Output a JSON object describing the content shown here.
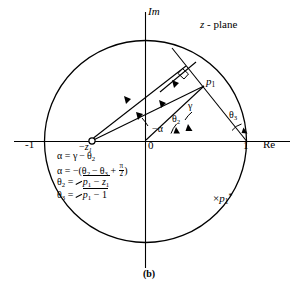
{
  "figure": {
    "caption": "(b)",
    "plane_label": "z - plane",
    "axes": {
      "imaginary_label": "Im",
      "real_label": "Re",
      "origin_label": "0",
      "unit_positive_label": "1",
      "unit_negative_label": "-1"
    },
    "points": [
      {
        "name": "zero-minus-z1",
        "label_base": "-z",
        "label_sub": "1",
        "marker": "circle"
      },
      {
        "name": "pole-p1",
        "label_base": "p",
        "label_sub": "1",
        "marker": "none"
      },
      {
        "name": "pole-p1-conjugate",
        "label_base": "p",
        "label_sub": "1",
        "label_sup": "*",
        "marker": "×"
      }
    ],
    "angles": [
      {
        "name": "alpha",
        "label": "−α"
      },
      {
        "name": "gamma",
        "label": "γ"
      },
      {
        "name": "theta2",
        "label_base": "θ",
        "label_sub": "2"
      },
      {
        "name": "theta3",
        "label_base": "θ",
        "label_sub": "3"
      }
    ],
    "equations": [
      {
        "id": "eq-alpha-gamma-theta2",
        "text": "α = γ − θ2"
      },
      {
        "id": "eq-alpha-expanded",
        "text": "α = −(θ2 − θ3 + π/2)"
      },
      {
        "id": "eq-theta2-def",
        "text": "θ2 = ∠ p1 − z1"
      },
      {
        "id": "eq-theta3-def",
        "text": "θ3 = ∠ p1 − 1"
      }
    ],
    "equation_tokens": {
      "alpha": "α",
      "gamma": "γ",
      "theta": "θ",
      "equals": "=",
      "minus": "−",
      "plus": "+",
      "pi": "π",
      "two": "2",
      "one": "1",
      "sub_1": "1",
      "sub_2": "2",
      "sub_3": "3",
      "p": "p",
      "z": "z",
      "paren_open": "(",
      "paren_close": ")",
      "neg_prefix": "−"
    },
    "colors": {
      "stroke": "#000000",
      "background": "#ffffff"
    },
    "unit_circle": {
      "radius_label": "1",
      "centered_at": "0"
    }
  }
}
